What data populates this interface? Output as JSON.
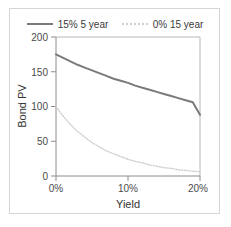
{
  "chart_data": {
    "type": "line",
    "title": "",
    "xlabel": "Yield",
    "ylabel": "Bond PV",
    "xlim": [
      0,
      20
    ],
    "ylim": [
      0,
      200
    ],
    "grid": false,
    "legend_position": "top",
    "x_tick_labels": [
      "0%",
      "10%",
      "20%"
    ],
    "x_ticks": [
      0,
      10,
      20
    ],
    "y_tick_labels": [
      "0",
      "50",
      "100",
      "150",
      "200"
    ],
    "y_ticks": [
      0,
      50,
      100,
      150,
      200
    ],
    "x": [
      0,
      1,
      2,
      3,
      4,
      5,
      6,
      7,
      8,
      9,
      10,
      11,
      12,
      13,
      14,
      15,
      16,
      17,
      18,
      19,
      20
    ],
    "series": [
      {
        "name": "15% 5 year",
        "style": "solid",
        "color": "#7a7a7a",
        "values": [
          175,
          170,
          165,
          160,
          156,
          152,
          148,
          144,
          140,
          137,
          134,
          130,
          127,
          124,
          121,
          118,
          115,
          112,
          109,
          106,
          88
        ]
      },
      {
        "name": "0% 15 year",
        "style": "dotted",
        "color": "#cfcfcf",
        "values": [
          100,
          86,
          74,
          64,
          56,
          48,
          42,
          36,
          32,
          28,
          24,
          21,
          19,
          16,
          14,
          12,
          11,
          9,
          8,
          7,
          6
        ]
      }
    ]
  },
  "legend": {
    "entries": [
      {
        "label": "15% 5 year"
      },
      {
        "label": "0% 15 year"
      }
    ]
  },
  "axes": {
    "y_title": "Bond PV",
    "x_title": "Yield"
  },
  "colors": {
    "series_solid": "#7a7a7a",
    "series_dotted": "#cfcfcf",
    "frame": "#b0b0b0",
    "outer_border": "#d6d6d6",
    "text": "#3a3a3a"
  }
}
